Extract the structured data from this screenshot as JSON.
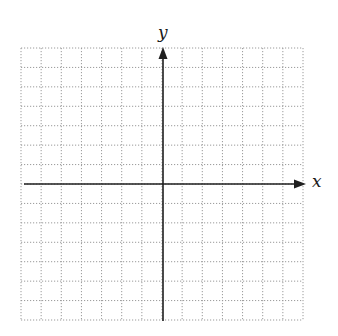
{
  "diagram": {
    "type": "coordinate-plane",
    "x_axis_label": "x",
    "y_axis_label": "y",
    "grid": {
      "cells_x": 14,
      "cells_y": 14,
      "cells_left_of_origin": 7,
      "cells_right_of_origin": 7,
      "cells_above_origin": 7,
      "cells_below_origin": 7,
      "line_style": "dotted"
    },
    "bounds_px": {
      "left": 21,
      "top": 48,
      "right": 303,
      "bottom": 320
    },
    "origin_px": {
      "x": 163,
      "y": 184
    },
    "colors": {
      "background": "#ffffff",
      "grid_line": "#9a9a9a",
      "axis": "#1f1f1f",
      "label": "#1a1a1a"
    }
  }
}
